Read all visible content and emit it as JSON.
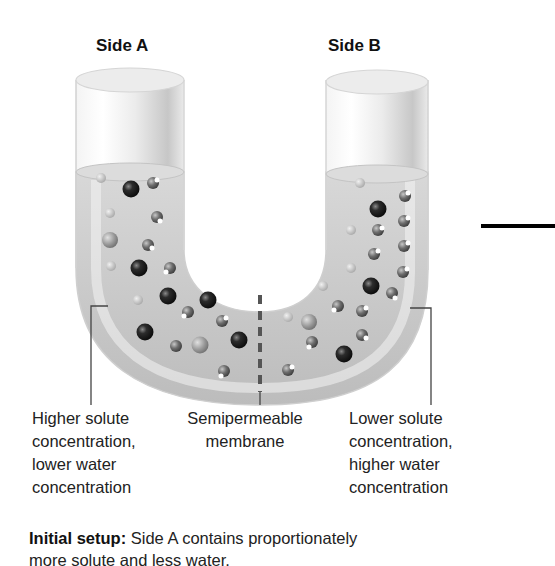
{
  "diagram": {
    "title_left": "Side A",
    "title_right": "Side B",
    "captions": {
      "left": [
        "Higher solute",
        "concentration,",
        "lower water",
        "concentration"
      ],
      "middle": [
        "Semipermeable",
        "membrane"
      ],
      "right": [
        "Lower solute",
        "concentration,",
        "higher water",
        "concentration"
      ]
    },
    "footer": {
      "label": "Initial setup:",
      "text_line1": " Side A contains proportionately",
      "text_line2": "more solute and less water."
    },
    "legend_semantics": {
      "dark-sphere": "solute molecule",
      "small-sphere-with-highlight": "water molecule"
    },
    "colors": {
      "tube_shade": "#b9b9b9",
      "solute": "#1e1e1e",
      "water": "#6a6a6a",
      "membrane": "#555555",
      "arrow": "#000000"
    }
  }
}
